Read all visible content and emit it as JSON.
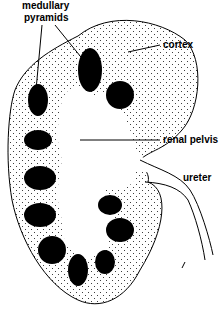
{
  "diagram": {
    "labels": {
      "medullary_pyramids_line1": "medullary",
      "medullary_pyramids_line2": "pyramids",
      "cortex": "cortex",
      "renal_pelvis": "renal pelvis",
      "ureter": "ureter"
    },
    "colors": {
      "ink": "#000000",
      "background": "#ffffff"
    }
  }
}
